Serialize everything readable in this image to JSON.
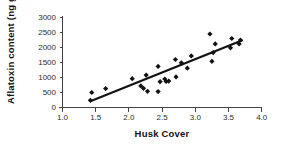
{
  "chart_data": {
    "type": "scatter",
    "title": "",
    "xlabel": "Husk Cover",
    "ylabel": "Aflatoxin content (ng g-1)",
    "ylabel_main": "Aflatoxin content (ng g",
    "ylabel_sup": "-1",
    "ylabel_close": ")",
    "xlim": [
      1.0,
      4.0
    ],
    "ylim": [
      0,
      3000
    ],
    "xticks": [
      "1.0",
      "1.5",
      "2.0",
      "2.5",
      "3.0",
      "3.5",
      "4.0"
    ],
    "xtick_values": [
      1.0,
      1.5,
      2.0,
      2.5,
      3.0,
      3.5,
      4.0
    ],
    "yticks": [
      "0",
      "500",
      "1000",
      "1500",
      "2000",
      "2500",
      "3000"
    ],
    "ytick_values": [
      0,
      500,
      1000,
      1500,
      2000,
      2500,
      3000
    ],
    "grid": false,
    "legend": "none",
    "marker": "diamond",
    "marker_color": "#111111",
    "points": [
      {
        "x": 1.42,
        "y": 240
      },
      {
        "x": 1.44,
        "y": 500
      },
      {
        "x": 1.65,
        "y": 630
      },
      {
        "x": 2.05,
        "y": 960
      },
      {
        "x": 2.18,
        "y": 720
      },
      {
        "x": 2.22,
        "y": 640
      },
      {
        "x": 2.26,
        "y": 1080
      },
      {
        "x": 2.28,
        "y": 540
      },
      {
        "x": 2.44,
        "y": 1370
      },
      {
        "x": 2.44,
        "y": 530
      },
      {
        "x": 2.47,
        "y": 860
      },
      {
        "x": 2.54,
        "y": 950
      },
      {
        "x": 2.56,
        "y": 870
      },
      {
        "x": 2.6,
        "y": 880
      },
      {
        "x": 2.7,
        "y": 1600
      },
      {
        "x": 2.71,
        "y": 1020
      },
      {
        "x": 2.79,
        "y": 1490
      },
      {
        "x": 2.88,
        "y": 1310
      },
      {
        "x": 2.94,
        "y": 1720
      },
      {
        "x": 3.22,
        "y": 2450
      },
      {
        "x": 3.25,
        "y": 1540
      },
      {
        "x": 3.27,
        "y": 1830
      },
      {
        "x": 3.3,
        "y": 2120
      },
      {
        "x": 3.53,
        "y": 1990
      },
      {
        "x": 3.55,
        "y": 2300
      },
      {
        "x": 3.66,
        "y": 2120
      },
      {
        "x": 3.68,
        "y": 2250
      }
    ],
    "trend_line": {
      "x1": 1.42,
      "y1": 210,
      "x2": 3.7,
      "y2": 2230
    }
  }
}
